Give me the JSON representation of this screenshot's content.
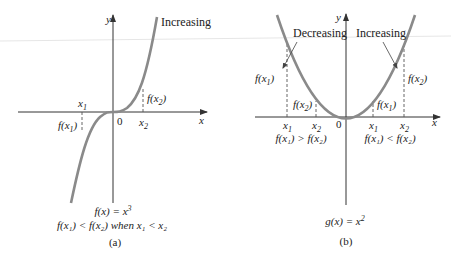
{
  "colors": {
    "curve": "#8a8a8a",
    "axis": "#333333",
    "text": "#222222",
    "dash": "#555555"
  },
  "panel_a": {
    "axis_x_label": "x",
    "axis_y_label": "y",
    "origin_label": "0",
    "curve_label": "Increasing",
    "x1_label": "x",
    "x1_sub": "1",
    "x2_label": "x",
    "x2_sub": "2",
    "fx1_label": "f(x",
    "fx1_sub": "1",
    "fx1_close": ")",
    "fx2_label": "f(x",
    "fx2_sub": "2",
    "fx2_close": ")",
    "equation_lhs": "f(x) = x",
    "equation_exp": "3",
    "condition": "f(x₁) < f(x₂) when x₁ < x₂",
    "caption": "(a)"
  },
  "panel_b": {
    "axis_x_label": "x",
    "axis_y_label": "y",
    "origin_label": "0",
    "left_label": "Decreasing",
    "right_label": "Increasing",
    "left_x1": "x",
    "left_x2": "x",
    "right_x1": "x",
    "right_x2": "x",
    "sub1": "1",
    "sub2": "2",
    "left_fx1": "f(x",
    "left_fx2": "f(x",
    "right_fx1": "f(x",
    "right_fx2": "f(x",
    "close": ")",
    "left_condition": "f(x₁) > f(x₂)",
    "right_condition": "f(x₁) < f(x₂)",
    "equation_lhs": "g(x) = x",
    "equation_exp": "2",
    "caption": "(b)"
  }
}
